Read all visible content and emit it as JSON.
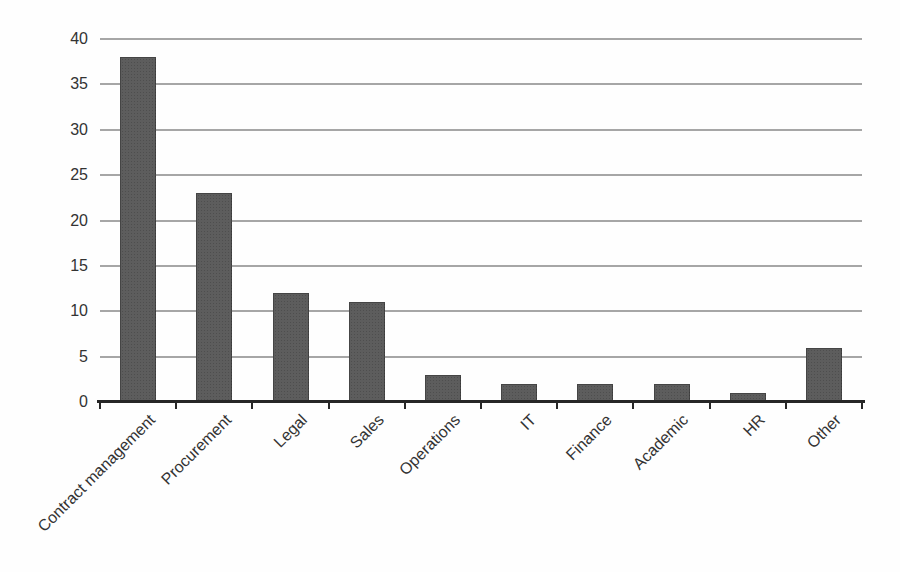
{
  "chart_data": {
    "type": "bar",
    "title": "",
    "xlabel": "",
    "ylabel": "",
    "categories": [
      "Contract management",
      "Procurement",
      "Legal",
      "Sales",
      "Operations",
      "IT",
      "Finance",
      "Academic",
      "HR",
      "Other"
    ],
    "values": [
      38,
      23,
      12,
      11,
      3,
      2,
      2,
      2,
      1,
      6
    ],
    "ylim": [
      0,
      40
    ],
    "yticks": [
      0,
      5,
      10,
      15,
      20,
      25,
      30,
      35,
      40
    ],
    "grid": "horizontal-only",
    "legend": "none",
    "bar_color": "#5d5d5d",
    "bar_dot_color": "#4e4e4e",
    "gridline_color": "#9c9c9c",
    "axis_color": "#262626",
    "label_color": "#333333",
    "background_color": "#fefefe"
  }
}
